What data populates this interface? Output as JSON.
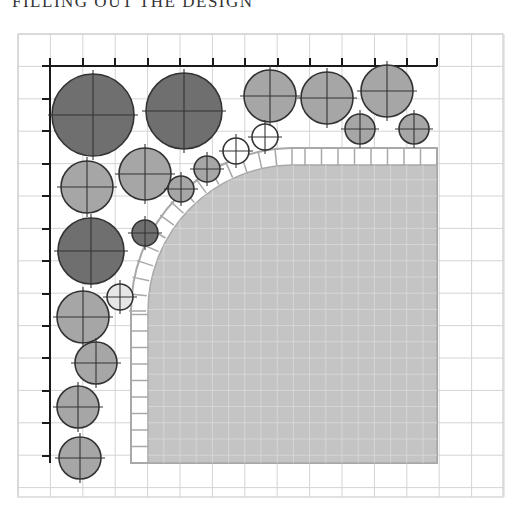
{
  "heading": "FILLING OUT THE DESIGN",
  "colors": {
    "grid": "#d4d4d4",
    "grid_border": "#cfcfcf",
    "axis": "#1a1a1a",
    "patio_fill": "#c4c4c4",
    "patio_grid": "#dadada",
    "tile_fill": "#ffffff",
    "tile_stroke": "#a8a8a8",
    "circle_stroke": "#333333",
    "dark": "#6f6f6f",
    "medium": "#a6a6a6",
    "light": "#e6e6e6",
    "open": "#ffffff"
  },
  "grid": {
    "x0": 18,
    "y0": 34,
    "x1": 503,
    "y1": 497,
    "step": 32.4
  },
  "axis": {
    "origin": [
      50,
      66
    ],
    "x_end": 437,
    "y_end": 463,
    "x_ticks": [
      50,
      83,
      115,
      148,
      180,
      213,
      245,
      278,
      310,
      342,
      375,
      407,
      437
    ],
    "y_ticks": [
      99,
      131,
      164,
      196,
      229,
      261,
      294,
      326,
      358,
      391,
      423,
      456
    ]
  },
  "patio": {
    "right": 437,
    "bottom": 463,
    "tile_outer_left": 131,
    "tile_inner_left": 148,
    "tile_outer_top": 148,
    "tile_inner_top": 165,
    "arc_center": [
      292,
      311
    ],
    "arc_outer_r": 163,
    "arc_inner_r": 146
  },
  "plants": [
    {
      "cx": 93,
      "cy": 115,
      "r": 41,
      "tone": "dark"
    },
    {
      "cx": 184,
      "cy": 111,
      "r": 38,
      "tone": "dark"
    },
    {
      "cx": 270,
      "cy": 96,
      "r": 26,
      "tone": "medium"
    },
    {
      "cx": 327,
      "cy": 98,
      "r": 26,
      "tone": "medium"
    },
    {
      "cx": 387,
      "cy": 91,
      "r": 26,
      "tone": "medium"
    },
    {
      "cx": 360,
      "cy": 129,
      "r": 15,
      "tone": "medium"
    },
    {
      "cx": 414,
      "cy": 129,
      "r": 15,
      "tone": "medium"
    },
    {
      "cx": 87,
      "cy": 187,
      "r": 26,
      "tone": "medium"
    },
    {
      "cx": 145,
      "cy": 174,
      "r": 26,
      "tone": "medium"
    },
    {
      "cx": 181,
      "cy": 189,
      "r": 13,
      "tone": "medium"
    },
    {
      "cx": 207,
      "cy": 169,
      "r": 13,
      "tone": "medium"
    },
    {
      "cx": 236,
      "cy": 151,
      "r": 13,
      "tone": "open"
    },
    {
      "cx": 265,
      "cy": 137,
      "r": 13,
      "tone": "open"
    },
    {
      "cx": 91,
      "cy": 251,
      "r": 33,
      "tone": "dark"
    },
    {
      "cx": 145,
      "cy": 233,
      "r": 13,
      "tone": "dark"
    },
    {
      "cx": 120,
      "cy": 297,
      "r": 13,
      "tone": "light"
    },
    {
      "cx": 83,
      "cy": 317,
      "r": 26,
      "tone": "medium"
    },
    {
      "cx": 96,
      "cy": 363,
      "r": 21,
      "tone": "medium"
    },
    {
      "cx": 78,
      "cy": 407,
      "r": 21,
      "tone": "medium"
    },
    {
      "cx": 80,
      "cy": 458,
      "r": 21,
      "tone": "medium"
    }
  ]
}
